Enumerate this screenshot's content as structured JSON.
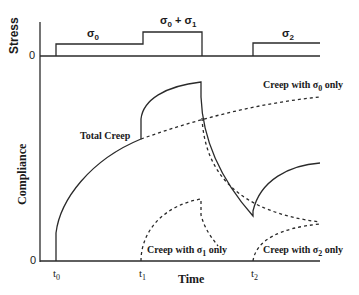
{
  "stress_panel": {
    "ylabel": "Stress",
    "zero_label": "0",
    "levels": [
      {
        "label": "σ",
        "sub": "0",
        "interval": "t0 to t1"
      },
      {
        "label": "σ",
        "sub": "0",
        "plus": " + σ",
        "sub2": "1",
        "interval": "t1 to t1+"
      },
      {
        "label": "σ",
        "sub": "2",
        "interval": "t2 onward"
      }
    ]
  },
  "compliance_panel": {
    "ylabel": "Compliance",
    "zero_label": "0",
    "xlabel": "Time",
    "ticks": [
      {
        "base": "t",
        "sub": "0"
      },
      {
        "base": "t",
        "sub": "1"
      },
      {
        "base": "t",
        "sub": "2"
      }
    ],
    "annotations": {
      "total": "Total Creep",
      "sigma0": {
        "pre": "Creep with σ",
        "sub": "0",
        "post": " only"
      },
      "sigma1": {
        "pre": "Creep with σ",
        "sub": "1",
        "post": " only"
      },
      "sigma2": {
        "pre": "Creep with σ",
        "sub": "2",
        "post": " only"
      }
    }
  },
  "colors": {
    "line": "#2a2a2a",
    "text": "#1a1a1a",
    "background": "#ffffff"
  }
}
